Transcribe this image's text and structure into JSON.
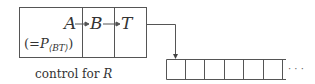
{
  "diagram": {
    "control_record": {
      "fields": [
        "A",
        "B",
        "T"
      ],
      "annotation_prefix": "(=",
      "annotation_symbol": "P",
      "annotation_subscript": "⟨BT⟩",
      "annotation_suffix": ")",
      "caption_prefix": "control for ",
      "caption_var": "R"
    },
    "array": {
      "cell_count": 7,
      "ellipsis": "· · ·"
    },
    "colors": {
      "stroke": "#555555",
      "text": "#333333"
    }
  }
}
